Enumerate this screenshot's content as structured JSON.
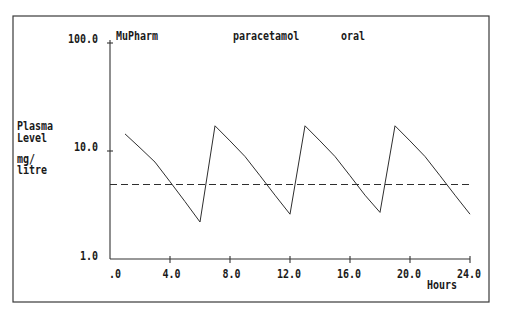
{
  "header": {
    "program": "MuPharm",
    "drug": "paracetamol",
    "route": "oral"
  },
  "axes": {
    "y_label_lines": [
      "Plasma",
      "Level",
      "mg/",
      "litre"
    ],
    "x_label": "Hours",
    "y_tick_labels": [
      "1.0",
      "10.0",
      "100.0"
    ],
    "x_tick_labels": [
      ".0",
      "4.0",
      "8.0",
      "12.0",
      "16.0",
      "20.0",
      "24.0"
    ]
  },
  "colors": {
    "background": "#ffffff",
    "line": "#2e2e2e",
    "text": "#1a1a1a"
  },
  "chart_data": {
    "type": "line",
    "title": "MuPharm   paracetamol   oral",
    "xlabel": "Hours",
    "ylabel": "Plasma Level mg/litre",
    "xlim": [
      0,
      24
    ],
    "ylim": [
      1,
      100
    ],
    "yscale": "log",
    "grid": false,
    "legend": "none",
    "x_ticks": [
      0,
      4,
      8,
      12,
      16,
      20,
      24
    ],
    "x_tick_labels": [
      ".0",
      "4.0",
      "8.0",
      "12.0",
      "16.0",
      "20.0",
      "24.0"
    ],
    "y_ticks": [
      1,
      10,
      100
    ],
    "y_tick_labels": [
      "1.0",
      "10.0",
      "100.0"
    ],
    "series": [
      {
        "name": "Plasma level",
        "style": "solid",
        "x": [
          1,
          2,
          3,
          4,
          5,
          6,
          7,
          8,
          9,
          10,
          11,
          12,
          13,
          14,
          15,
          16,
          17,
          18,
          19,
          20,
          21,
          22,
          23,
          24
        ],
        "values": [
          14.4,
          10.7,
          7.9,
          5.2,
          3.4,
          2.2,
          17.1,
          12.4,
          8.9,
          5.9,
          3.9,
          2.6,
          17.1,
          12.4,
          8.9,
          5.9,
          3.9,
          2.7,
          17.1,
          12.4,
          8.9,
          5.9,
          3.9,
          2.6
        ]
      },
      {
        "name": "Reference level",
        "style": "dashed",
        "x": [
          0,
          24
        ],
        "values": [
          4.9,
          4.9
        ]
      }
    ]
  }
}
